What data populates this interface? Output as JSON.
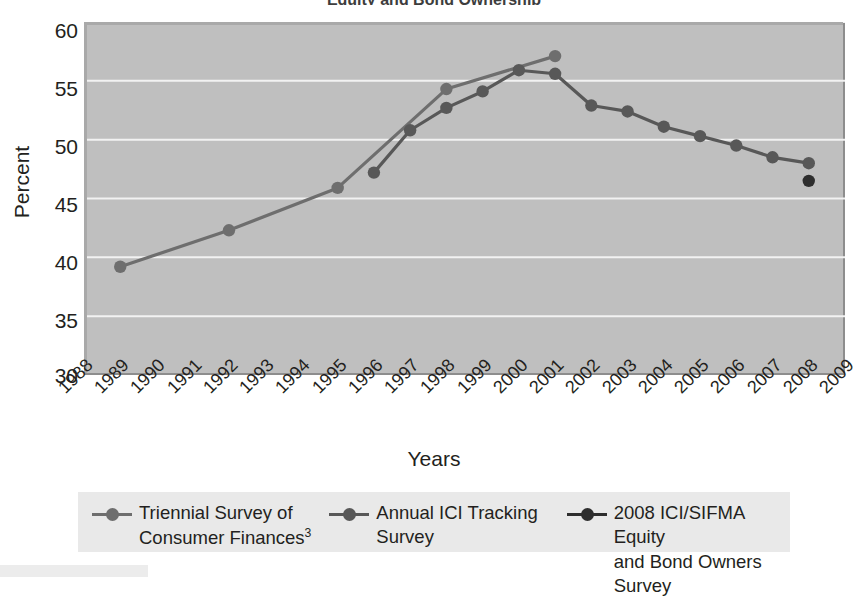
{
  "chart_data": {
    "type": "line",
    "title": "Equity and Bond Ownership",
    "xlabel": "Years",
    "ylabel": "Percent",
    "ylim": [
      30,
      60
    ],
    "ytick_values": [
      60,
      55,
      50,
      45,
      40,
      35,
      30
    ],
    "ytick_labels": [
      "60",
      "55",
      "50",
      "45",
      "40",
      "35",
      "30"
    ],
    "xlim": [
      1988,
      2009
    ],
    "xtick_labels": [
      "1988",
      "1989",
      "1990",
      "1991",
      "1992",
      "1993",
      "1994",
      "1995",
      "1996",
      "1997",
      "1998",
      "1999",
      "2000",
      "2001",
      "2002",
      "2003",
      "2004",
      "2005",
      "2006",
      "2007",
      "2008",
      "2009"
    ],
    "grid": "horizontal",
    "legend_position": "bottom",
    "plot_background": "#bfbfbf",
    "series": [
      {
        "name": "Triennial Survey of Consumer Finances",
        "name_superscript": "3",
        "color": "#6e6e6e",
        "marker": "circle",
        "x": [
          1989,
          1992,
          1995,
          1998,
          2001
        ],
        "values": [
          39.2,
          42.3,
          45.9,
          54.3,
          57.1
        ]
      },
      {
        "name": "Annual ICI Tracking Survey",
        "color": "#585858",
        "marker": "circle",
        "x": [
          1996,
          1997,
          1998,
          1999,
          2000,
          2001,
          2002,
          2003,
          2004,
          2005,
          2006,
          2007,
          2008
        ],
        "values": [
          47.2,
          50.8,
          52.7,
          54.1,
          55.9,
          55.6,
          52.9,
          52.4,
          51.1,
          50.3,
          49.5,
          48.5,
          48.0
        ]
      },
      {
        "name": "2008 ICI/SIFMA Equity and Bond Owners Survey",
        "color": "#2e2e2e",
        "marker": "circle",
        "x": [
          2008
        ],
        "values": [
          46.5
        ]
      }
    ]
  },
  "legend": {
    "items": [
      {
        "label_line1": "Triennial Survey of",
        "label_line2": "Consumer Finances",
        "superscript": "3",
        "color": "#6e6e6e"
      },
      {
        "label_line1": "Annual ICI Tracking",
        "label_line2": "Survey",
        "superscript": "",
        "color": "#585858"
      },
      {
        "label_line1": "2008 ICI/SIFMA Equity",
        "label_line2": "and Bond Owners Survey",
        "superscript": "",
        "color": "#2e2e2e"
      }
    ]
  }
}
